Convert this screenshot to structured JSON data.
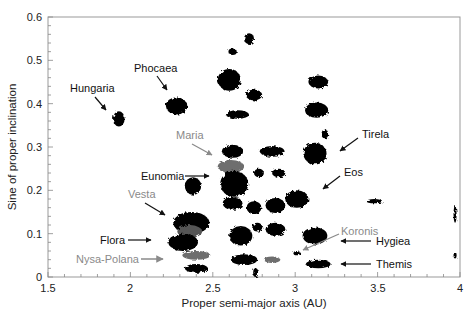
{
  "chart_data": {
    "type": "scatter",
    "title": "",
    "xlabel": "Proper semi-major axis (AU)",
    "ylabel": "Sine of proper inclination",
    "xlim": [
      1.5,
      4.0
    ],
    "ylim": [
      0,
      0.6
    ],
    "xticks": [
      "1.5",
      "2",
      "2.5",
      "3",
      "3.5",
      "4"
    ],
    "yticks": [
      "0",
      "0.1",
      "0.2",
      "0.3",
      "0.4",
      "0.5",
      "0.6"
    ],
    "grid": false,
    "colors": {
      "background": "#000000",
      "highlight": "#6e6e6e",
      "label_gray": "#8a8a8a",
      "label_black": "#111111"
    },
    "clusters": [
      {
        "a": 1.93,
        "sini": 0.365,
        "w": 0.07,
        "h": 0.035,
        "color": "#000000",
        "name": "Hungaria"
      },
      {
        "a": 2.28,
        "sini": 0.395,
        "w": 0.13,
        "h": 0.04,
        "color": "#000000",
        "name": "Phocaea"
      },
      {
        "a": 2.6,
        "sini": 0.455,
        "w": 0.14,
        "h": 0.05,
        "color": "#000000"
      },
      {
        "a": 2.62,
        "sini": 0.52,
        "w": 0.05,
        "h": 0.015,
        "color": "#000000"
      },
      {
        "a": 2.72,
        "sini": 0.55,
        "w": 0.06,
        "h": 0.025,
        "color": "#000000"
      },
      {
        "a": 2.75,
        "sini": 0.42,
        "w": 0.1,
        "h": 0.025,
        "color": "#000000"
      },
      {
        "a": 2.65,
        "sini": 0.375,
        "w": 0.14,
        "h": 0.02,
        "color": "#000000"
      },
      {
        "a": 3.14,
        "sini": 0.45,
        "w": 0.12,
        "h": 0.03,
        "color": "#000000"
      },
      {
        "a": 3.13,
        "sini": 0.385,
        "w": 0.14,
        "h": 0.035,
        "color": "#000000"
      },
      {
        "a": 3.18,
        "sini": 0.33,
        "w": 0.04,
        "h": 0.02,
        "color": "#000000"
      },
      {
        "a": 3.12,
        "sini": 0.285,
        "w": 0.14,
        "h": 0.05,
        "color": "#000000",
        "name": "Eos-Tirela region"
      },
      {
        "a": 2.62,
        "sini": 0.29,
        "w": 0.13,
        "h": 0.03,
        "color": "#000000"
      },
      {
        "a": 2.86,
        "sini": 0.29,
        "w": 0.15,
        "h": 0.025,
        "color": "#000000"
      },
      {
        "a": 2.61,
        "sini": 0.255,
        "w": 0.16,
        "h": 0.03,
        "color": "#6e6e6e",
        "name": "Maria"
      },
      {
        "a": 2.63,
        "sini": 0.215,
        "w": 0.17,
        "h": 0.06,
        "color": "#000000",
        "name": "Eunomia"
      },
      {
        "a": 2.78,
        "sini": 0.24,
        "w": 0.06,
        "h": 0.02,
        "color": "#000000"
      },
      {
        "a": 2.9,
        "sini": 0.24,
        "w": 0.08,
        "h": 0.02,
        "color": "#000000"
      },
      {
        "a": 3.01,
        "sini": 0.18,
        "w": 0.14,
        "h": 0.04,
        "color": "#000000",
        "name": "Eos"
      },
      {
        "a": 3.48,
        "sini": 0.175,
        "w": 0.1,
        "h": 0.01,
        "color": "#000000"
      },
      {
        "a": 2.38,
        "sini": 0.21,
        "w": 0.1,
        "h": 0.04,
        "color": "#000000"
      },
      {
        "a": 2.37,
        "sini": 0.125,
        "w": 0.22,
        "h": 0.05,
        "color": "#000000"
      },
      {
        "a": 2.36,
        "sini": 0.105,
        "w": 0.15,
        "h": 0.03,
        "color": "#555555",
        "name": "Vesta"
      },
      {
        "a": 2.32,
        "sini": 0.08,
        "w": 0.18,
        "h": 0.04,
        "color": "#000000",
        "name": "Flora"
      },
      {
        "a": 2.4,
        "sini": 0.05,
        "w": 0.17,
        "h": 0.02,
        "color": "#6e6e6e",
        "name": "Nysa-Polana"
      },
      {
        "a": 2.4,
        "sini": 0.02,
        "w": 0.14,
        "h": 0.02,
        "color": "#000000"
      },
      {
        "a": 2.62,
        "sini": 0.17,
        "w": 0.12,
        "h": 0.03,
        "color": "#000000"
      },
      {
        "a": 2.75,
        "sini": 0.16,
        "w": 0.09,
        "h": 0.03,
        "color": "#000000"
      },
      {
        "a": 2.88,
        "sini": 0.165,
        "w": 0.12,
        "h": 0.035,
        "color": "#000000"
      },
      {
        "a": 2.67,
        "sini": 0.095,
        "w": 0.14,
        "h": 0.045,
        "color": "#000000"
      },
      {
        "a": 2.77,
        "sini": 0.115,
        "w": 0.06,
        "h": 0.02,
        "color": "#000000"
      },
      {
        "a": 2.88,
        "sini": 0.11,
        "w": 0.12,
        "h": 0.03,
        "color": "#000000"
      },
      {
        "a": 2.69,
        "sini": 0.04,
        "w": 0.16,
        "h": 0.025,
        "color": "#000000"
      },
      {
        "a": 2.86,
        "sini": 0.04,
        "w": 0.1,
        "h": 0.015,
        "color": "#6e6e6e"
      },
      {
        "a": 2.76,
        "sini": 0.01,
        "w": 0.03,
        "h": 0.02,
        "color": "#000000"
      },
      {
        "a": 3.12,
        "sini": 0.095,
        "w": 0.15,
        "h": 0.04,
        "color": "#000000",
        "name": "Hygiea"
      },
      {
        "a": 3.01,
        "sini": 0.055,
        "w": 0.04,
        "h": 0.01,
        "color": "#000000"
      },
      {
        "a": 3.14,
        "sini": 0.03,
        "w": 0.15,
        "h": 0.02,
        "color": "#000000",
        "name": "Themis"
      },
      {
        "a": 3.97,
        "sini": 0.145,
        "w": 0.01,
        "h": 0.04,
        "color": "#000000"
      },
      {
        "a": 3.97,
        "sini": 0.05,
        "w": 0.008,
        "h": 0.015,
        "color": "#000000"
      }
    ],
    "annotations": [
      {
        "text": "Hungaria",
        "color": "#111111"
      },
      {
        "text": "Phocaea",
        "color": "#111111"
      },
      {
        "text": "Maria",
        "color": "#8a8a8a"
      },
      {
        "text": "Eunomia",
        "color": "#111111"
      },
      {
        "text": "Vesta",
        "color": "#8a8a8a"
      },
      {
        "text": "Flora",
        "color": "#111111"
      },
      {
        "text": "Nysa-Polana",
        "color": "#8a8a8a"
      },
      {
        "text": "Tirela",
        "color": "#111111"
      },
      {
        "text": "Eos",
        "color": "#111111"
      },
      {
        "text": "Koronis",
        "color": "#8a8a8a"
      },
      {
        "text": "Hygiea",
        "color": "#111111"
      },
      {
        "text": "Themis",
        "color": "#111111"
      }
    ]
  }
}
